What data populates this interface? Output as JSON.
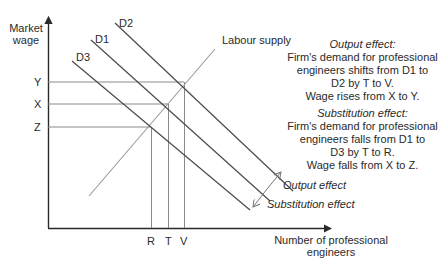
{
  "diagram": {
    "y_axis_title": [
      "Market",
      "wage"
    ],
    "x_axis_title": [
      "Number of professional",
      "engineers"
    ],
    "y_ticks": [
      {
        "label": "Y",
        "y": 82
      },
      {
        "label": "X",
        "y": 104
      },
      {
        "label": "Z",
        "y": 127
      }
    ],
    "x_ticks": [
      {
        "label": "R",
        "x": 151
      },
      {
        "label": "T",
        "x": 168
      },
      {
        "label": "V",
        "x": 184
      }
    ],
    "curves": [
      {
        "id": "D2",
        "label": "D2",
        "type": "demand"
      },
      {
        "id": "D1",
        "label": "D1",
        "type": "demand"
      },
      {
        "id": "D3",
        "label": "D3",
        "type": "demand"
      },
      {
        "id": "supply",
        "label": "Labour supply",
        "type": "supply"
      }
    ],
    "arrow_labels": {
      "output": "Output effect",
      "substitution": "Substitution effect"
    },
    "annotations": {
      "output": {
        "heading": "Output effect:",
        "lines": [
          "Firm's demand for professional",
          "engineers shifts from D1 to",
          "D2  by T to V.",
          "Wage rises from X to Y."
        ]
      },
      "substitution": {
        "heading": "Substitution effect:",
        "lines": [
          "Firm's demand for professional",
          "engineers falls from D1 to",
          "D3 by T to R.",
          "Wage falls from X to Z."
        ]
      }
    },
    "colors": {
      "axis": "#2a2a2a",
      "demand": "#4a4a4a",
      "supply": "#9a9a9a",
      "guides": "#8a8a8a",
      "text": "#2a2a2a"
    }
  }
}
